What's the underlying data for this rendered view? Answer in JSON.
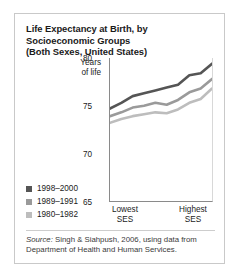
{
  "card": {
    "title_lines": [
      "Life Expectancy at Birth, by",
      "Socioeconomic Groups",
      "(Both Sexes, United States)"
    ],
    "source_prefix": "Source:",
    "source_text": " Singh & Siahpush, 2006, using data from Department of Health and Human Services."
  },
  "axis": {
    "ylabel_line1": "Years",
    "ylabel_line2": "of life",
    "xcap_low_line1": "Lowest",
    "xcap_low_line2": "SES",
    "xcap_high_line1": "Highest",
    "xcap_high_line2": "SES"
  },
  "legend": [
    {
      "label": "1998–2000",
      "color": "#555555"
    },
    {
      "label": "1989–1991",
      "color": "#9a9a9a"
    },
    {
      "label": "1980–1982",
      "color": "#bdbdbd"
    }
  ],
  "chart_data": {
    "type": "line",
    "title": "Life Expectancy at Birth, by Socioeconomic Groups (Both Sexes, United States)",
    "xlabel": "",
    "ylabel": "Years of life",
    "ylim": [
      65,
      80
    ],
    "yticks": [
      80,
      75,
      70,
      65
    ],
    "xlim": [
      1,
      10
    ],
    "xtick_labels": [
      "Lowest SES",
      "Highest SES"
    ],
    "grid": false,
    "legend_position": "bottom-left",
    "x": [
      1,
      2,
      3,
      4,
      5,
      6,
      7,
      8,
      9,
      10
    ],
    "series": [
      {
        "name": "1998–2000",
        "color": "#555555",
        "values": [
          74.7,
          75.3,
          76.0,
          76.3,
          76.6,
          76.9,
          77.2,
          78.2,
          78.4,
          79.4
        ]
      },
      {
        "name": "1989–1991",
        "color": "#9a9a9a",
        "values": [
          73.9,
          74.3,
          74.8,
          75.0,
          75.3,
          75.1,
          75.6,
          76.4,
          76.8,
          77.8
        ]
      },
      {
        "name": "1980–1982",
        "color": "#bdbdbd",
        "values": [
          73.2,
          73.6,
          73.9,
          74.1,
          74.3,
          74.2,
          74.6,
          75.3,
          75.7,
          76.8
        ]
      }
    ]
  }
}
